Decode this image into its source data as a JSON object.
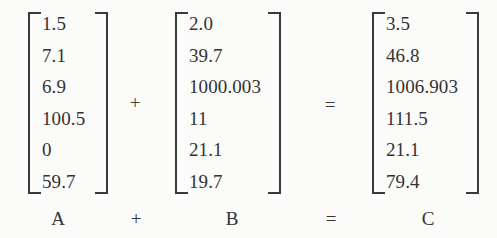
{
  "chart_data": {
    "type": "table",
    "title": "",
    "expression": "A + B = C",
    "matrices": [
      {
        "name": "A",
        "values": [
          "1.5",
          "7.1",
          "6.9",
          "100.5",
          "0",
          "59.7"
        ]
      },
      {
        "name": "B",
        "values": [
          "2.0",
          "39.7",
          "1000.003",
          "11",
          "21.1",
          "19.7"
        ]
      },
      {
        "name": "C",
        "values": [
          "3.5",
          "46.8",
          "1006.903",
          "111.5",
          "21.1",
          "79.4"
        ]
      }
    ],
    "operators": [
      "+",
      "="
    ],
    "rows": 6,
    "columns": 1
  },
  "equation": {
    "matrix_a": {
      "label": "A",
      "cells": [
        "1.5",
        "7.1",
        "6.9",
        "100.5",
        "0",
        "59.7"
      ]
    },
    "matrix_b": {
      "label": "B",
      "cells": [
        "2.0",
        "39.7",
        "1000.003",
        "11",
        "21.1",
        "19.7"
      ]
    },
    "matrix_c": {
      "label": "C",
      "cells": [
        "3.5",
        "46.8",
        "1006.903",
        "111.5",
        "21.1",
        "79.4"
      ]
    },
    "operator_plus": "+",
    "operator_equals": "=",
    "label_plus": "+",
    "label_equals": "="
  },
  "colors": {
    "background": "#fbfbfa",
    "text": "#333333",
    "bracket": "#3a3a3a"
  }
}
